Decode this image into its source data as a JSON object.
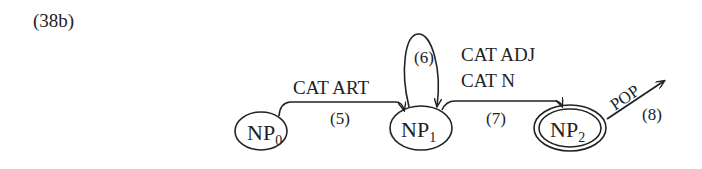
{
  "figure": {
    "label": "(38b)"
  },
  "nodes": [
    {
      "id": "NP0",
      "base": "NP",
      "sub": "0",
      "final": false
    },
    {
      "id": "NP1",
      "base": "NP",
      "sub": "1",
      "final": false
    },
    {
      "id": "NP2",
      "base": "NP",
      "sub": "2",
      "final": true
    }
  ],
  "arcs": [
    {
      "number": "(5)",
      "from": "NP0",
      "to": "NP1",
      "label": "CAT ART"
    },
    {
      "number": "(6)",
      "from": "NP1",
      "to": "NP1",
      "label": ""
    },
    {
      "number": "(7)",
      "from": "NP1",
      "to": "NP2",
      "label_line1": "CAT ADJ",
      "label_line2": "CAT N"
    },
    {
      "number": "(8)",
      "from": "NP2",
      "to": "",
      "label": "POP"
    }
  ],
  "colors": {
    "ink": "#222222",
    "background": "#ffffff"
  }
}
